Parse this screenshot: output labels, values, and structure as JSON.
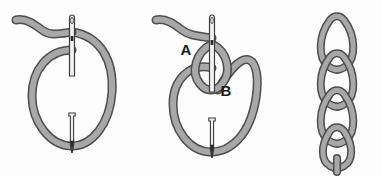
{
  "figure": {
    "background_color": "#fdfdfd",
    "thread_fill_color": "#a8a8a8",
    "thread_outline_color": "#4d4d4d",
    "needle_fill_color": "#f2f2f2",
    "needle_outline_color": "#3c3c3c",
    "needle_tip_color": "#2b2b2b",
    "label_color": "#1a1a1a"
  },
  "panels": [
    {
      "id": "panel-1",
      "name": "step-one-loop-formed",
      "caption": "",
      "elements": {
        "thread_tail": "thread-tail-curve",
        "loop": "large-oval-loop",
        "needle": "needle-through-fabric"
      },
      "labels": []
    },
    {
      "id": "panel-2",
      "name": "step-two-loop-tightened",
      "caption": "",
      "elements": {
        "thread_tail": "thread-tail-curve",
        "loop_outer": "large-oval-loop",
        "loop_inner": "small-teardrop-loop",
        "needle": "needle-through-fabric"
      },
      "labels": [
        {
          "id": "label-a",
          "text": "A",
          "x": 186,
          "y": 55
        },
        {
          "id": "label-b",
          "text": "B",
          "x": 222,
          "y": 96
        }
      ]
    },
    {
      "id": "panel-3",
      "name": "step-three-completed-chain",
      "caption": "",
      "elements": {
        "chain_links": "teardrop-chain-links",
        "link_count": 4,
        "tail": "chain-end-tail"
      },
      "labels": []
    }
  ]
}
